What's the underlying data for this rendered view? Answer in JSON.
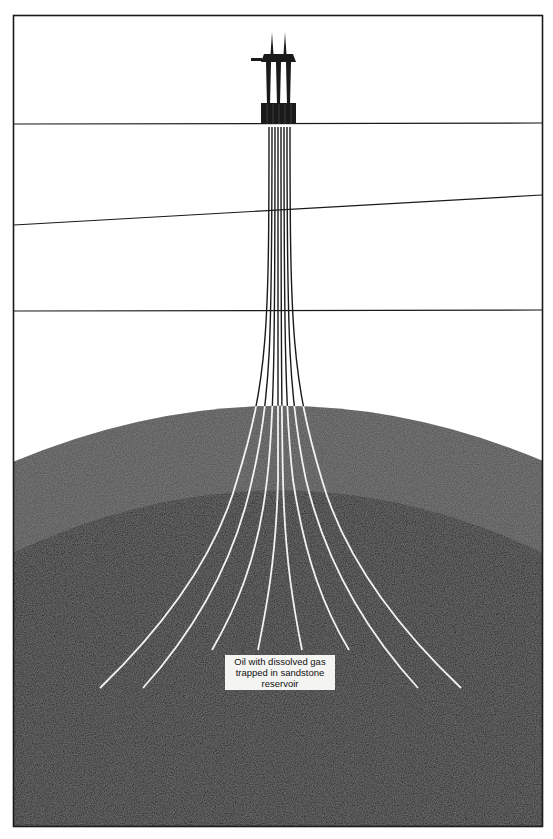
{
  "figure": {
    "type": "cross-section diagram",
    "colors": {
      "background": "#ffffff",
      "frame": "#1a1a1a",
      "water_strata": "#ffffff",
      "cap_rock": "#4a4a4a",
      "reservoir": "#151515",
      "well_lines_above": "#1a1a1a",
      "well_lines_in_rock": "#f2f2f2",
      "label_background": "#f4f4f2"
    },
    "layers": [
      {
        "name": "sea",
        "top_y": 15,
        "bottom_y": 124
      },
      {
        "name": "upper-stratum",
        "bottom_left_y": 225,
        "bottom_right_y": 195
      },
      {
        "name": "middle-stratum",
        "bottom_y": 311
      },
      {
        "name": "cap-rock",
        "top_center_y": 405,
        "top_edge_y": 461
      },
      {
        "name": "reservoir",
        "top_center_y": 490,
        "top_edge_y": 553
      }
    ],
    "well_count": 8
  },
  "label": {
    "line1": "Oil with dissolved gas",
    "line2": "trapped in sandstone",
    "line3": "reservoir"
  }
}
